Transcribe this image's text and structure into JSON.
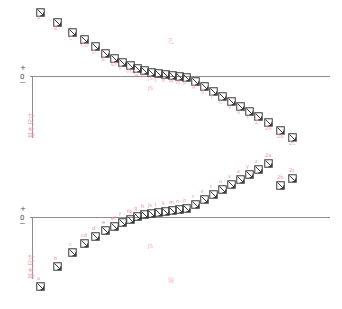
{
  "figure": {
    "background": "#ffffff",
    "axis_color": "#8d8d8d",
    "label_color": "#f4a6b4",
    "marker_color": "#3a3a3a"
  },
  "panels": [
    {
      "id": "top-panel",
      "axis": {
        "y_caption": "基本尺寸",
        "y_sign_top": "+",
        "y_sign_bottom": "－",
        "zero_label": "0"
      },
      "notes": [
        {
          "text": "孔",
          "x": 168,
          "y": 36
        },
        {
          "text": "JS",
          "x": 148,
          "y": 85
        }
      ],
      "chart_data": {
        "type": "scatter",
        "title": "",
        "xlabel": "",
        "ylabel": "基本尺寸",
        "series_name": "上偏差",
        "labels": [
          "A",
          "B",
          "C",
          "CD",
          "D",
          "E",
          "EF",
          "F",
          "FG",
          "G",
          "H",
          "JS",
          "J",
          "K",
          "M",
          "N",
          "P",
          "R",
          "S",
          "T",
          "U",
          "V",
          "X",
          "Y",
          "Z",
          "2A",
          "2B",
          "2C"
        ],
        "x": [
          40,
          57,
          72,
          84,
          95,
          105,
          114,
          122,
          130,
          137,
          144,
          151,
          158,
          165,
          172,
          179,
          186,
          195,
          204,
          213,
          222,
          231,
          240,
          249,
          258,
          268,
          280,
          292
        ],
        "y": [
          12,
          22,
          32,
          39,
          46,
          53,
          58,
          62,
          65,
          68,
          70,
          72,
          73,
          74,
          75,
          76,
          77,
          81,
          86,
          91,
          96,
          101,
          106,
          111,
          116,
          122,
          130,
          137
        ]
      }
    },
    {
      "id": "bottom-panel",
      "axis": {
        "y_caption": "基本尺寸",
        "y_sign_top": "+",
        "y_sign_bottom": "－",
        "zero_label": "0"
      },
      "notes": [
        {
          "text": "JS",
          "x": 148,
          "y": 243
        },
        {
          "text": "轴",
          "x": 168,
          "y": 275
        }
      ],
      "chart_data": {
        "type": "scatter",
        "title": "",
        "xlabel": "",
        "ylabel": "基本尺寸",
        "series_name": "下偏差",
        "labels": [
          "a",
          "b",
          "c",
          "cd",
          "d",
          "e",
          "ef",
          "f",
          "fg",
          "g",
          "h",
          "js",
          "j",
          "k",
          "m",
          "n",
          "p",
          "r",
          "s",
          "t",
          "u",
          "v",
          "x",
          "y",
          "z",
          "2a",
          "2b",
          "2c"
        ],
        "x": [
          40,
          57,
          72,
          84,
          95,
          105,
          114,
          122,
          130,
          137,
          144,
          151,
          158,
          165,
          172,
          179,
          186,
          195,
          204,
          213,
          222,
          231,
          240,
          249,
          258,
          268,
          280,
          292
        ],
        "y": [
          286,
          266,
          252,
          243,
          236,
          230,
          226,
          222,
          219,
          216,
          214,
          213,
          212,
          211,
          210,
          209,
          208,
          204,
          199,
          194,
          189,
          184,
          179,
          174,
          169,
          163,
          185,
          178
        ]
      }
    }
  ]
}
